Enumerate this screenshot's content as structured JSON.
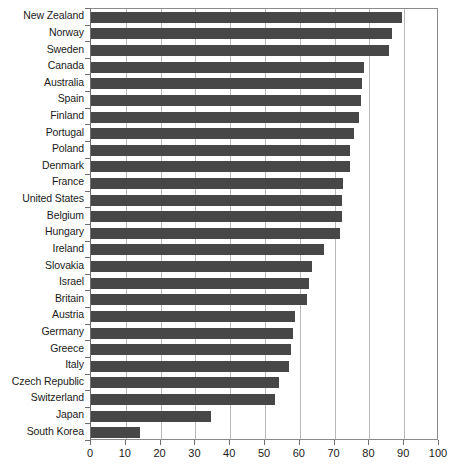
{
  "chart_data": {
    "type": "bar",
    "orientation": "horizontal",
    "title": "",
    "subtitle": "",
    "xlabel": "",
    "ylabel": "",
    "xlim": [
      0,
      100
    ],
    "ylim": null,
    "grid": "vertical-gridlines-only",
    "legend": "none",
    "series_color": "#474747",
    "xticks": [
      0,
      10,
      20,
      30,
      40,
      50,
      60,
      70,
      80,
      90,
      100
    ],
    "xtick_labels": [
      "0",
      "10",
      "20",
      "30",
      "40",
      "50",
      "60",
      "70",
      "80",
      "90",
      "100"
    ],
    "categories": [
      "New Zealand",
      "Norway",
      "Sweden",
      "Canada",
      "Australia",
      "Spain",
      "Finland",
      "Portugal",
      "Poland",
      "Denmark",
      "France",
      "United States",
      "Belgium",
      "Hungary",
      "Ireland",
      "Slovakia",
      "Israel",
      "Britain",
      "Austria",
      "Germany",
      "Greece",
      "Italy",
      "Czech Republic",
      "Switzerland",
      "Japan",
      "South Korea"
    ],
    "values": [
      89.5,
      86.5,
      85.5,
      78.5,
      78,
      77.5,
      77,
      75.5,
      74.5,
      74.5,
      72.5,
      72,
      72,
      71.5,
      67,
      63.5,
      62.5,
      62,
      58.5,
      58,
      57.5,
      57,
      54,
      53,
      34.5,
      14
    ]
  },
  "colors": {
    "bar": "#474747",
    "gridline": "#b9b9b9",
    "axis": "#6e6e6e",
    "frame": "#8a8a8a",
    "text": "#1a1a1a",
    "background": "#ffffff"
  }
}
